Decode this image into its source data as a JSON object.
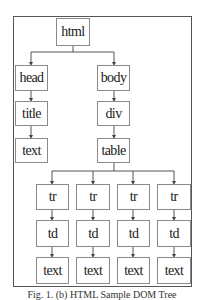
{
  "diagram": {
    "title": "HTML Sample DOM Tree",
    "nodes": {
      "html": "html",
      "head": "head",
      "body": "body",
      "title": "title",
      "head_text": "text",
      "div": "div",
      "table": "table",
      "tr": [
        "tr",
        "tr",
        "tr",
        "tr"
      ],
      "td": [
        "td",
        "td",
        "td",
        "td"
      ],
      "td_text": [
        "text",
        "text",
        "text",
        "text"
      ]
    },
    "edges": [
      [
        "html",
        "head"
      ],
      [
        "html",
        "body"
      ],
      [
        "head",
        "title"
      ],
      [
        "title",
        "text"
      ],
      [
        "body",
        "div"
      ],
      [
        "div",
        "table"
      ],
      [
        "table",
        "tr"
      ],
      [
        "table",
        "tr"
      ],
      [
        "table",
        "tr"
      ],
      [
        "table",
        "tr"
      ],
      [
        "tr",
        "td"
      ],
      [
        "td",
        "text"
      ]
    ],
    "caption": "Fig. 1. (b) HTML Sample DOM Tree"
  }
}
